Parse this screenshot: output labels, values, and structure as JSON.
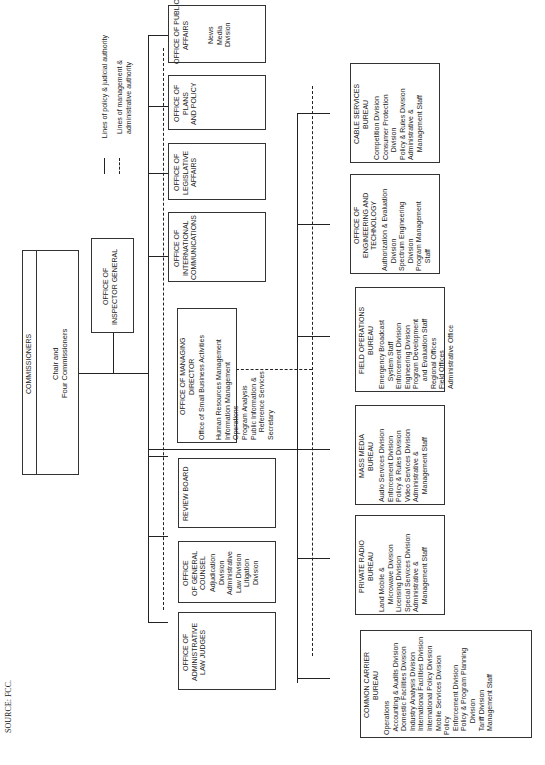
{
  "source": "SOURCE:  FCC.",
  "legend": {
    "solid": "Lines of policy & judicial authority",
    "dashed": "Lines of management &\nadministrative authority"
  },
  "commissioners": {
    "title": "COMMISSIONERS",
    "body": "Chair and\nFour Commissioners"
  },
  "inspector_general": {
    "title": "OFFICE OF\nINSPECTOR GENERAL"
  },
  "staff_offices": [
    {
      "title": "OFFICE OF PUBLIC\nAFFAIRS",
      "body": "News\nMedia\nDivision"
    },
    {
      "title": "OFFICE OF\nPLANS\nAND POLICY",
      "body": ""
    },
    {
      "title": "OFFICE OF\nLEGISLATIVE\nAFFAIRS",
      "body": ""
    },
    {
      "title": "OFFICE OF\nINTERNATIONAL\nCOMMUNICATIONS",
      "body": ""
    },
    {
      "title": "OFFICE OF MANAGING\nDIRECTOR",
      "body": "Office of Small Business Activities\n\nHuman Resources Management\nInformation Management\nOperations\nProgram Analysis\nPublic Information &\n    Reference Services\nSecretary"
    },
    {
      "title": "REVIEW BOARD",
      "body": ""
    },
    {
      "title": "OFFICE\nOF GENERAL\nCOUNSEL",
      "body": "Adjudication\nDivision\nAdministrative\nLaw Division\nLitigation\nDivision"
    },
    {
      "title": "OFFICE OF\nADMINISTRATIVE\nLAW JUDGES",
      "body": ""
    }
  ],
  "bureaus": [
    {
      "title": "CABLE SERVICES\nBUREAU",
      "body": "Competition Division\nConsumer Protection\n    Division\nPolicy & Rules Division\nAdministrative &\n    Management Staff"
    },
    {
      "title": "OFFICE OF\nENGINEERING AND\nTECHNOLOGY",
      "body": "Authorization & Evaluation\n    Division\nSpectrum Engineering\n    Division\nProgram Management\n    Staff"
    },
    {
      "title": "FIELD OPERATIONS\nBUREAU",
      "body": "Emergency Broadcast\n    System Staff\nEnforcement Division\nEngineering Division\nProgram Development\n    and Evaluation Staff\nRegional Offices\nField Offices\nAdministrative Office"
    },
    {
      "title": "MASS MEDIA\nBUREAU",
      "body": "Audio Services Division\nEnforcement Division\nPolicy & Rules Division\nVideo Services Division\nAdministrative &\n    Management Staff"
    },
    {
      "title": "PRIVATE RADIO\nBUREAU",
      "body": "Land Mobile &\n    Microwave Division\nLicensing Division\nSpecial Services Division\nAdministrative &\n    Management Staff"
    },
    {
      "title": "COMMON CARRIER\nBUREAU",
      "body": "Operations\n  Accounting & Audits Division\n  Domestic Facilities Division\n  Industry Analysis Division\n  International Facilities Division\n  International Policy Division\n  Mobile Services Division\nPolicy\n  Enforcement Division\n  Policy & Program Planning\n      Division\n  Tariff Division\n  Management Staff"
    }
  ]
}
